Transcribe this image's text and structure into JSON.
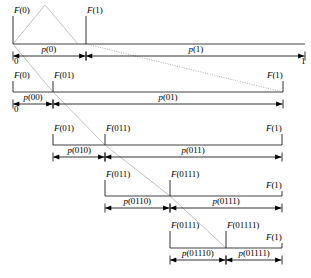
{
  "figure": {
    "colors": {
      "axis": "#808080",
      "ink": "#000000",
      "guide": "#a8a8a8",
      "dotted": "#9a9a9a",
      "background": "#ffffff"
    },
    "rows": [
      {
        "id": "row-0",
        "baseline_y": 44,
        "x_start": 13,
        "x_mid": 86,
        "x_end": 305,
        "tick_labels": [
          {
            "text": "F(0)",
            "x": 13,
            "y": 6,
            "anchor": "start"
          },
          {
            "text": "F(1)",
            "x": 86,
            "y": 6,
            "anchor": "start"
          }
        ],
        "segment_labels": [
          {
            "text": "p(0)",
            "x": 49,
            "y": 45
          },
          {
            "text": "p(1)",
            "x": 196,
            "y": 45
          }
        ],
        "end_labels": [
          {
            "text": "0",
            "x": 13,
            "y": 57,
            "anchor": "start"
          },
          {
            "text": "1",
            "x": 305,
            "y": 57,
            "anchor": "end"
          }
        ]
      },
      {
        "id": "row-1",
        "baseline_y": 92,
        "x_start": 13,
        "x_mid": 53,
        "x_end": 283,
        "tick_labels": [
          {
            "text": "F(0)",
            "x": 13,
            "y": 71,
            "anchor": "start"
          },
          {
            "text": "F(01)",
            "x": 53,
            "y": 71,
            "anchor": "start"
          },
          {
            "text": "F(1)",
            "x": 283,
            "y": 71,
            "anchor": "end"
          }
        ],
        "segment_labels": [
          {
            "text": "p(00)",
            "x": 33,
            "y": 93
          },
          {
            "text": "p(01)",
            "x": 168,
            "y": 93
          }
        ],
        "end_labels": [
          {
            "text": "0",
            "x": 13,
            "y": 105,
            "anchor": "start"
          }
        ]
      },
      {
        "id": "row-2",
        "baseline_y": 145,
        "x_start": 53,
        "x_mid": 105,
        "x_end": 282,
        "tick_labels": [
          {
            "text": "F(01)",
            "x": 53,
            "y": 124,
            "anchor": "start"
          },
          {
            "text": "F(011)",
            "x": 105,
            "y": 124,
            "anchor": "start"
          },
          {
            "text": "F(1)",
            "x": 282,
            "y": 124,
            "anchor": "end"
          }
        ],
        "segment_labels": [
          {
            "text": "p(010)",
            "x": 79,
            "y": 146
          },
          {
            "text": "p(011)",
            "x": 193,
            "y": 146
          }
        ],
        "end_labels": []
      },
      {
        "id": "row-3",
        "baseline_y": 196,
        "x_start": 105,
        "x_mid": 170,
        "x_end": 282,
        "tick_labels": [
          {
            "text": "F(011)",
            "x": 105,
            "y": 170,
            "anchor": "start"
          },
          {
            "text": "F(0111)",
            "x": 170,
            "y": 170,
            "anchor": "start"
          },
          {
            "text": "F(1)",
            "x": 282,
            "y": 181,
            "anchor": "end"
          }
        ],
        "segment_labels": [
          {
            "text": "p(0110)",
            "x": 137,
            "y": 197
          },
          {
            "text": "p(0111)",
            "x": 226,
            "y": 197
          }
        ],
        "end_labels": []
      },
      {
        "id": "row-4",
        "baseline_y": 248,
        "x_start": 170,
        "x_mid": 226,
        "x_end": 282,
        "tick_labels": [
          {
            "text": "F(0111)",
            "x": 170,
            "y": 221,
            "anchor": "start"
          },
          {
            "text": "F(01111)",
            "x": 226,
            "y": 221,
            "anchor": "start"
          },
          {
            "text": "F(1)",
            "x": 282,
            "y": 233,
            "anchor": "end"
          }
        ],
        "segment_labels": [
          {
            "text": "p(01110)",
            "x": 198,
            "y": 249
          },
          {
            "text": "p(01111)",
            "x": 254,
            "y": 249
          }
        ],
        "end_labels": []
      }
    ],
    "triangle": {
      "label": "density-triangle",
      "points": "13,44 45,5 78,44"
    },
    "dotted_guide": {
      "label": "upper-bound-guide",
      "x1": 86,
      "y1": 44,
      "x2": 283,
      "y2": 92
    },
    "diagonal_guides": [
      {
        "label": "lower-bound-guide-a",
        "x1": 13,
        "y1": 44,
        "x2": 53,
        "y2": 92
      },
      {
        "label": "lower-bound-guide-b",
        "x1": 53,
        "y1": 92,
        "x2": 105,
        "y2": 145
      },
      {
        "label": "lower-bound-guide-c",
        "x1": 105,
        "y1": 145,
        "x2": 170,
        "y2": 196
      },
      {
        "label": "lower-bound-guide-d",
        "x1": 170,
        "y1": 196,
        "x2": 226,
        "y2": 248
      }
    ]
  }
}
